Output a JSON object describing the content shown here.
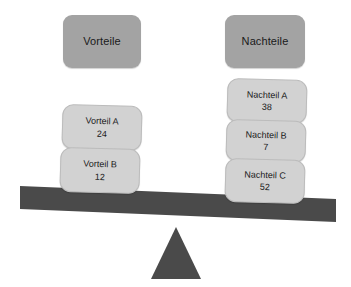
{
  "diagram": {
    "colors": {
      "header_box": "#a3a3a3",
      "item_box": "#d2d2d2",
      "beam": "#4a4a4a",
      "fulcrum": "#4a4a4a",
      "text": "#1a1a1a",
      "background": "#ffffff"
    }
  },
  "left_column": {
    "header": "Vorteile",
    "items": [
      {
        "label": "Vorteil A",
        "value": "24"
      },
      {
        "label": "Vorteil B",
        "value": "12"
      }
    ]
  },
  "right_column": {
    "header": "Nachteile",
    "items": [
      {
        "label": "Nachteil A",
        "value": "38"
      },
      {
        "label": "Nachteil B",
        "value": "7"
      },
      {
        "label": "Nachteil C",
        "value": "52"
      }
    ]
  },
  "balance": {
    "tilt": "right-side-down",
    "beam_left_y": 187,
    "beam_right_y": 200,
    "fulcrum_apex_x": 176
  }
}
